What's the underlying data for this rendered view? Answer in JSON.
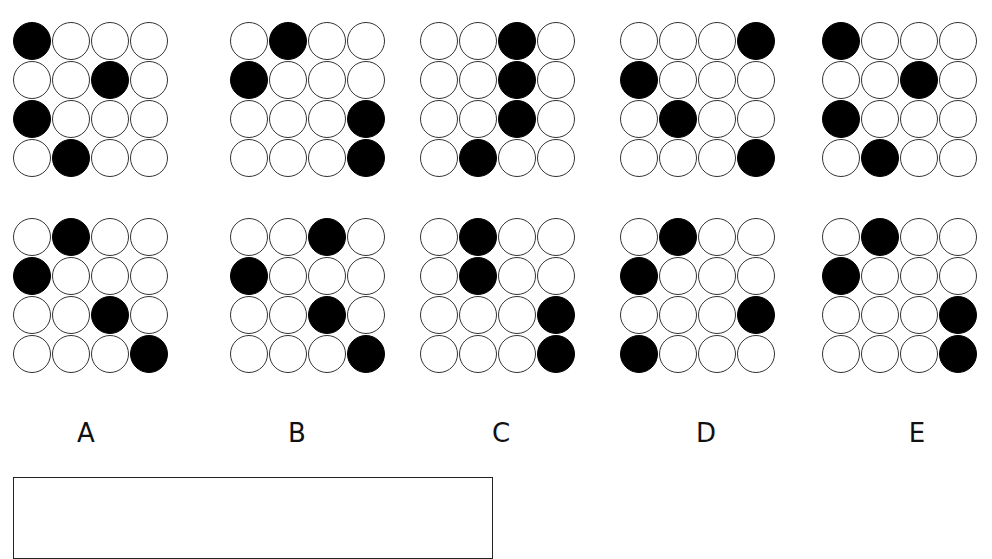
{
  "puzzle": {
    "rows": 4,
    "cols": 4,
    "options": [
      {
        "label": "A",
        "top_grid": [
          [
            1,
            0,
            0,
            0
          ],
          [
            0,
            0,
            1,
            0
          ],
          [
            1,
            0,
            0,
            0
          ],
          [
            0,
            1,
            0,
            0
          ]
        ],
        "bottom_grid": [
          [
            0,
            1,
            0,
            0
          ],
          [
            1,
            0,
            0,
            0
          ],
          [
            0,
            0,
            1,
            0
          ],
          [
            0,
            0,
            0,
            1
          ]
        ]
      },
      {
        "label": "B",
        "top_grid": [
          [
            0,
            1,
            0,
            0
          ],
          [
            1,
            0,
            0,
            0
          ],
          [
            0,
            0,
            0,
            1
          ],
          [
            0,
            0,
            0,
            1
          ]
        ],
        "bottom_grid": [
          [
            0,
            0,
            1,
            0
          ],
          [
            1,
            0,
            0,
            0
          ],
          [
            0,
            0,
            1,
            0
          ],
          [
            0,
            0,
            0,
            1
          ]
        ]
      },
      {
        "label": "C",
        "top_grid": [
          [
            0,
            0,
            1,
            0
          ],
          [
            0,
            0,
            1,
            0
          ],
          [
            0,
            0,
            1,
            0
          ],
          [
            0,
            1,
            0,
            0
          ]
        ],
        "bottom_grid": [
          [
            0,
            1,
            0,
            0
          ],
          [
            0,
            1,
            0,
            0
          ],
          [
            0,
            0,
            0,
            1
          ],
          [
            0,
            0,
            0,
            1
          ]
        ]
      },
      {
        "label": "D",
        "top_grid": [
          [
            0,
            0,
            0,
            1
          ],
          [
            1,
            0,
            0,
            0
          ],
          [
            0,
            1,
            0,
            0
          ],
          [
            0,
            0,
            0,
            1
          ]
        ],
        "bottom_grid": [
          [
            0,
            1,
            0,
            0
          ],
          [
            1,
            0,
            0,
            0
          ],
          [
            0,
            0,
            0,
            1
          ],
          [
            1,
            0,
            0,
            0
          ]
        ]
      },
      {
        "label": "E",
        "top_grid": [
          [
            1,
            0,
            0,
            0
          ],
          [
            0,
            0,
            1,
            0
          ],
          [
            1,
            0,
            0,
            0
          ],
          [
            0,
            1,
            0,
            0
          ]
        ],
        "bottom_grid": [
          [
            0,
            1,
            0,
            0
          ],
          [
            1,
            0,
            0,
            0
          ],
          [
            0,
            0,
            0,
            1
          ],
          [
            0,
            0,
            0,
            1
          ]
        ]
      }
    ],
    "answer_box": {
      "value": ""
    }
  },
  "colors": {
    "filled": "#000000",
    "empty": "#ffffff",
    "outline": "#333333"
  }
}
